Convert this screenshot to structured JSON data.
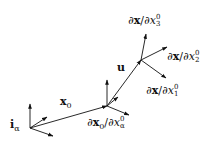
{
  "diagram": {
    "labels": {
      "i_alpha": "iα",
      "x0": "x0",
      "u": "u",
      "dx0_dxa0": "∂x0/∂x0α",
      "dx_dx10": "∂x/∂x01",
      "dx_dx20": "∂x/∂x02",
      "dx_dx30": "∂x/∂x03"
    },
    "label_parts": {
      "i_alpha": {
        "base": "i",
        "sub": "α"
      },
      "x0": {
        "base": "x",
        "sub": "0"
      },
      "u": {
        "base": "u"
      },
      "dx0_dxa0": {
        "num": "∂x",
        "num_sub": "0",
        "den": "/∂x",
        "den_sup": "0",
        "den_sub": "α"
      },
      "dx_dx10": {
        "num": "∂x",
        "den": "/∂x",
        "den_sup": "0",
        "den_sub": "1"
      },
      "dx_dx20": {
        "num": "∂x",
        "den": "/∂x",
        "den_sup": "0",
        "den_sub": "2"
      },
      "dx_dx30": {
        "num": "∂x",
        "den": "/∂x",
        "den_sup": "0",
        "den_sub": "3"
      }
    },
    "stroke_color": "#111111",
    "background": "#ffffff"
  }
}
